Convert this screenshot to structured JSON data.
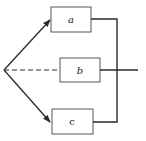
{
  "diagram": {
    "colors": {
      "stroke": "#2a2a2a",
      "box_fill": "#ffffff",
      "background": "#ffffff"
    },
    "origin": {
      "x": 4,
      "y": 70
    },
    "boxes": [
      {
        "id": "a",
        "label": "a",
        "x": 51,
        "y": 7,
        "w": 40,
        "h": 25
      },
      {
        "id": "b",
        "label": "b",
        "x": 60,
        "y": 58,
        "w": 40,
        "h": 24
      },
      {
        "id": "c",
        "label": "c",
        "x": 52,
        "y": 109,
        "w": 41,
        "h": 25
      }
    ],
    "edges": [
      {
        "from": "origin",
        "to": "a",
        "style": "solid-arrow"
      },
      {
        "from": "origin",
        "to": "b",
        "style": "dashed"
      },
      {
        "from": "origin",
        "to": "c",
        "style": "solid-arrow"
      },
      {
        "from": "a",
        "to": "junction",
        "style": "solid"
      },
      {
        "from": "c",
        "to": "junction",
        "style": "solid"
      },
      {
        "from": "b",
        "to": "output",
        "style": "solid"
      }
    ],
    "junction_x": 117,
    "output_x": 138
  }
}
